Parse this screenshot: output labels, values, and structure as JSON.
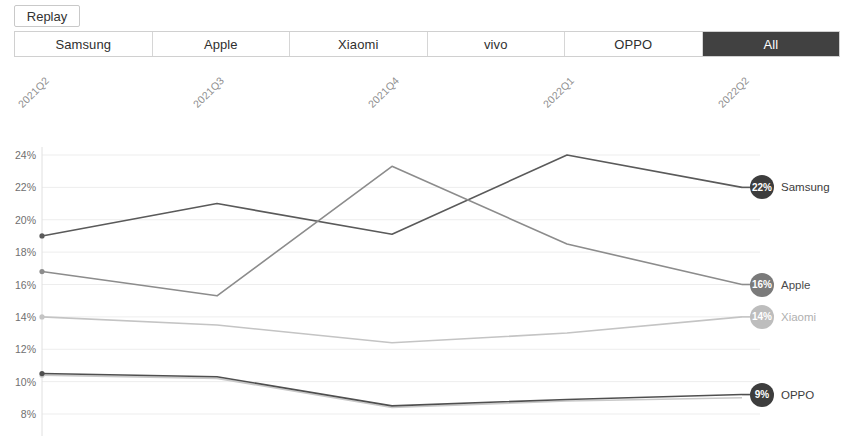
{
  "toolbar": {
    "replay_label": "Replay"
  },
  "tabs": [
    {
      "label": "Samsung",
      "selected": false
    },
    {
      "label": "Apple",
      "selected": false
    },
    {
      "label": "Xiaomi",
      "selected": false
    },
    {
      "label": "vivo",
      "selected": false
    },
    {
      "label": "OPPO",
      "selected": false
    },
    {
      "label": "All",
      "selected": true
    }
  ],
  "chart_data": {
    "type": "line",
    "title": "",
    "xlabel": "",
    "ylabel": "",
    "categories": [
      "2021Q2",
      "2021Q3",
      "2021Q4",
      "2022Q1",
      "2022Q2"
    ],
    "ylim": [
      8,
      24
    ],
    "ytick_labels": [
      "24%",
      "22%",
      "20%",
      "18%",
      "16%",
      "14%",
      "12%",
      "10%",
      "8%"
    ],
    "ytick_values": [
      24,
      22,
      20,
      18,
      16,
      14,
      12,
      10,
      8
    ],
    "grid": true,
    "legend_position": "right-end-labels",
    "series": [
      {
        "name": "Samsung",
        "color": "#5a5a5a",
        "badge_color": "#3d3d3d",
        "label_color": "#3c3c3c",
        "values": [
          19.0,
          21.0,
          19.1,
          24.0,
          22.0
        ],
        "end_label": "22%"
      },
      {
        "name": "Apple",
        "color": "#8c8c8c",
        "badge_color": "#7a7a7a",
        "label_color": "#4a4a4a",
        "values": [
          16.8,
          15.3,
          23.3,
          18.5,
          16.0
        ],
        "end_label": "16%"
      },
      {
        "name": "Xiaomi",
        "color": "#c4c4c4",
        "badge_color": "#bdbdbd",
        "label_color": "#b0b0b0",
        "values": [
          14.0,
          13.5,
          12.4,
          13.0,
          14.0
        ],
        "end_label": "14%"
      },
      {
        "name": "vivo",
        "color": "#c9c9c9",
        "badge_color": "#c0c0c0",
        "label_color": "#b5b5b5",
        "values": [
          10.4,
          10.2,
          8.4,
          8.8,
          9.0
        ],
        "end_label": ""
      },
      {
        "name": "OPPO",
        "color": "#4f4f4f",
        "badge_color": "#3d3d3d",
        "label_color": "#3c3c3c",
        "values": [
          10.5,
          10.3,
          8.5,
          8.9,
          9.2
        ],
        "end_label": "9%"
      }
    ]
  }
}
